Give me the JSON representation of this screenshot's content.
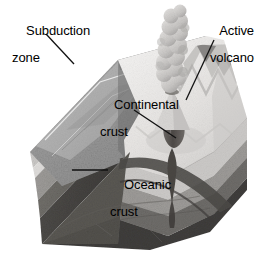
{
  "figure": {
    "kind": "geological-cross-section-block",
    "background_color": "#ffffff"
  },
  "labels": {
    "subduction_zone": {
      "line1": "Subduction",
      "line2": "zone",
      "leader": "diagonal-down-right"
    },
    "active_volcano": {
      "line1": "Active",
      "line2": "volcano",
      "leader": "diagonal-down-left"
    },
    "continental_crust": {
      "line1": "Continental",
      "line2": "crust",
      "leader": "diagonal-down-right"
    },
    "oceanic_crust": {
      "line1": "Oceanic",
      "line2": "crust",
      "leader": "horizontal-left"
    }
  },
  "colors": {
    "label_text": "#000000",
    "leader_line": "#111111",
    "sky": "#ffffff",
    "ocean_plate_top": "#9b9b9b",
    "ocean_plate_top_light": "#b4b4b4",
    "continent_top": "#eceaea",
    "continent_top_shadow": "#d2d0cf",
    "upper_crust_band": "#c8c6c4",
    "mid_crust_band": "#9a9895",
    "lower_crust_band": "#6e6c6a",
    "mantle_band": "#4a4846",
    "deep_mantle": "#393735",
    "magma_conduit": "#5a5653",
    "plume_cloud": "#cfcdcb",
    "plume_cloud_shadow": "#a5a3a1",
    "trench_dark": "#3f3d3b"
  },
  "features": {
    "oceanic_plate": "subducting slab descending to the left-right trench",
    "continental_plate": "overriding block with mountainous top surface",
    "trench": "v-shaped depression where plates meet",
    "volcano": "active cone emitting a billowing ash plume",
    "magma_conduit": "bulbous dark channel rising from slab to volcano",
    "strata": [
      "upper crust",
      "middle crust",
      "lower crust",
      "mantle"
    ]
  }
}
